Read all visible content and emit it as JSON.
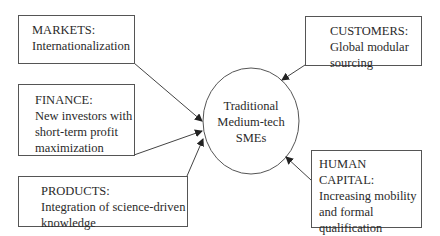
{
  "center": {
    "label": "Traditional\nMedium-tech\nSMEs"
  },
  "boxes": [
    {
      "id": "markets",
      "heading": "MARKETS:",
      "text": "Internationalization"
    },
    {
      "id": "finance",
      "heading": "FINANCE:",
      "text": "New investors with\nshort-term profit\nmaximization"
    },
    {
      "id": "products",
      "heading": "PRODUCTS:",
      "text": "Integration of science-driven\nknowledge"
    },
    {
      "id": "customers",
      "heading": "CUSTOMERS:",
      "text": "Global modular\nsourcing"
    },
    {
      "id": "human_capital",
      "heading": "HUMAN CAPITAL:",
      "text": "Increasing mobility\nand formal\nqualification\nrequirements"
    }
  ],
  "colors": {
    "line": "#444444",
    "border": "#555555",
    "text": "#2a2a2a"
  }
}
